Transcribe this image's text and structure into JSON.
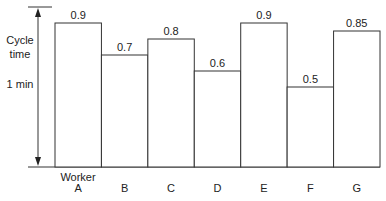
{
  "chart_data": {
    "type": "bar",
    "title": "",
    "xlabel": "Worker",
    "ylabel": "Cycle time",
    "reference_label": "1 min",
    "reference_value": 1.0,
    "categories": [
      "A",
      "B",
      "C",
      "D",
      "E",
      "F",
      "G"
    ],
    "values": [
      0.9,
      0.7,
      0.8,
      0.6,
      0.9,
      0.5,
      0.85
    ],
    "value_labels": [
      "0.9",
      "0.7",
      "0.8",
      "0.6",
      "0.9",
      "0.5",
      "0.85"
    ],
    "ylim": [
      0,
      1.0
    ],
    "grid": false,
    "legend": "none"
  },
  "labels": {
    "cycle": "Cycle",
    "time": "time",
    "one_min": "1 min",
    "worker": "Worker"
  }
}
